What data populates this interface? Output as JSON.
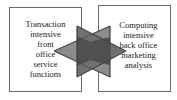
{
  "diagram": {
    "left_box": {
      "label": "Transaction\nintensive\nfront\noffice\nservice\nfunctions"
    },
    "right_box": {
      "label": "Computing\nintensive\nback office\nmarketing\nanalysis"
    },
    "connector": {
      "type": "bidirectional-overlapping-triangles",
      "left_triangle_color": "#8a8a8a",
      "right_triangle_color": "#6e6e6e",
      "overlap_color": "#4e4e4e"
    },
    "colors": {
      "box_border": "#6a6a6a",
      "text": "#222222",
      "background": "#ffffff"
    }
  }
}
